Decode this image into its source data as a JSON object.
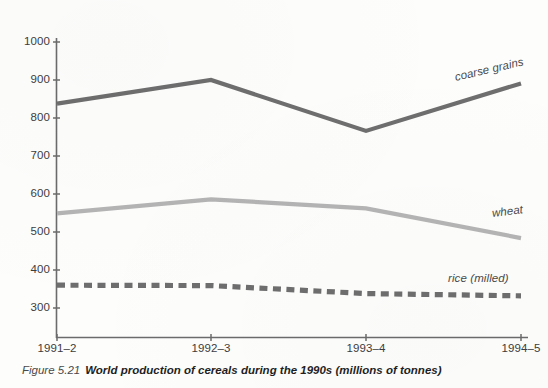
{
  "caption": {
    "figure_number": "Figure 5.21",
    "text": "World production of cereals during the 1990s (millions of tonnes)"
  },
  "colors": {
    "coarse_grains": "#6e6e6e",
    "wheat": "#b4b4b4",
    "rice": "#6e6e6e",
    "axis": "#6b6b6b",
    "text": "#3c3c3c"
  },
  "axes": {
    "y_ticks": [
      "1000",
      "900",
      "800",
      "700",
      "600",
      "500",
      "400",
      "300"
    ],
    "x_ticks": [
      "1991–2",
      "1992–3",
      "1993–4",
      "1994–5"
    ]
  },
  "series_labels": {
    "coarse_grains": "coarse grains",
    "wheat": "wheat",
    "rice": "rice (milled)"
  },
  "chart_data": {
    "type": "line",
    "title": "World production of cereals during the 1990s (millions of tonnes)",
    "xlabel": "",
    "ylabel": "",
    "categories": [
      "1991–2",
      "1992–3",
      "1993–4",
      "1994–5"
    ],
    "ylim": [
      240,
      1020
    ],
    "yticks": [
      300,
      400,
      500,
      600,
      700,
      800,
      900,
      1000
    ],
    "grid": false,
    "legend": "inline-right-of-series",
    "series": [
      {
        "name": "coarse grains",
        "values": [
          838,
          900,
          766,
          891
        ],
        "color": "#6e6e6e",
        "style": "solid",
        "width": 4
      },
      {
        "name": "wheat",
        "values": [
          549,
          586,
          562,
          484
        ],
        "color": "#b4b4b4",
        "style": "solid",
        "width": 4
      },
      {
        "name": "rice (milled)",
        "values": [
          360,
          359,
          338,
          332
        ],
        "color": "#6e6e6e",
        "style": "dashed",
        "width": 5
      }
    ]
  }
}
